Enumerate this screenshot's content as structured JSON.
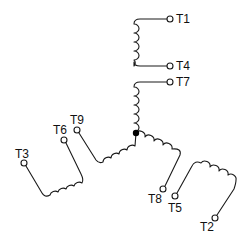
{
  "diagram": {
    "terminals": [
      {
        "id": "T1",
        "label": "T1"
      },
      {
        "id": "T4",
        "label": "T4"
      },
      {
        "id": "T7",
        "label": "T7"
      },
      {
        "id": "T9",
        "label": "T9"
      },
      {
        "id": "T6",
        "label": "T6"
      },
      {
        "id": "T3",
        "label": "T3"
      },
      {
        "id": "T8",
        "label": "T8"
      },
      {
        "id": "T5",
        "label": "T5"
      },
      {
        "id": "T2",
        "label": "T2"
      }
    ],
    "coils": [
      {
        "name": "coil-t1-t4",
        "from": "T1",
        "to": "T4"
      },
      {
        "name": "coil-t7-star",
        "from": "T7",
        "to": "star-point"
      },
      {
        "name": "coil-t9-star",
        "from": "T9",
        "to": "star-point"
      },
      {
        "name": "coil-t8-star",
        "from": "T8",
        "to": "star-point"
      },
      {
        "name": "coil-t3-t6",
        "from": "T3",
        "to": "T6"
      },
      {
        "name": "coil-t2-t5",
        "from": "T2",
        "to": "T5"
      }
    ],
    "colors": {
      "line": "#1a1a1a",
      "background": "#ffffff"
    }
  }
}
